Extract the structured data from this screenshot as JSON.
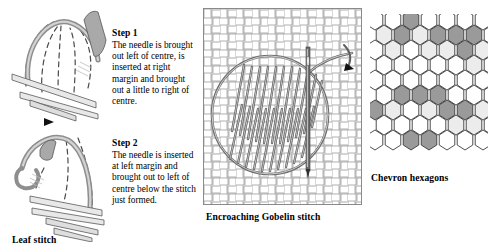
{
  "page": {
    "background_color": "#ffffff"
  },
  "panels": {
    "leaf": {
      "caption": "Leaf stitch",
      "steps": [
        {
          "title": "Step 1",
          "body": "The needle is brought out left of centre, is inserted at right margin and brought out a little to right of centre."
        },
        {
          "title": "Step 2",
          "body": "The needle is inserted at left margin and brought out to left of centre below the stitch just formed."
        }
      ]
    },
    "gobelin": {
      "caption": "Encroaching Gobelin stitch",
      "canvas_color": "#f2f2f0",
      "thread_color": "#777777",
      "needle_color": "#555555"
    },
    "hexagons": {
      "caption": "Chevron hexagons",
      "colors": {
        "white": "#ffffff",
        "light": "#ececec",
        "dark": "#9a9a9a",
        "outline": "#3a3a3a"
      },
      "grid": {
        "columns": 7,
        "rows": 9,
        "legend": "0 = white, 1 = light grey, 2 = dark grey",
        "cells": [
          [
            0,
            0,
            2,
            0,
            0,
            0,
            0
          ],
          [
            1,
            2,
            1,
            2,
            2,
            2,
            0
          ],
          [
            0,
            1,
            0,
            1,
            1,
            2,
            1
          ],
          [
            0,
            0,
            0,
            0,
            0,
            1,
            0
          ],
          [
            0,
            0,
            0,
            0,
            0,
            0,
            0
          ],
          [
            0,
            2,
            2,
            2,
            0,
            0,
            0
          ],
          [
            2,
            1,
            0,
            1,
            2,
            2,
            1
          ],
          [
            0,
            0,
            0,
            0,
            1,
            1,
            0
          ],
          [
            0,
            0,
            2,
            2,
            0,
            0,
            0
          ]
        ]
      }
    }
  }
}
